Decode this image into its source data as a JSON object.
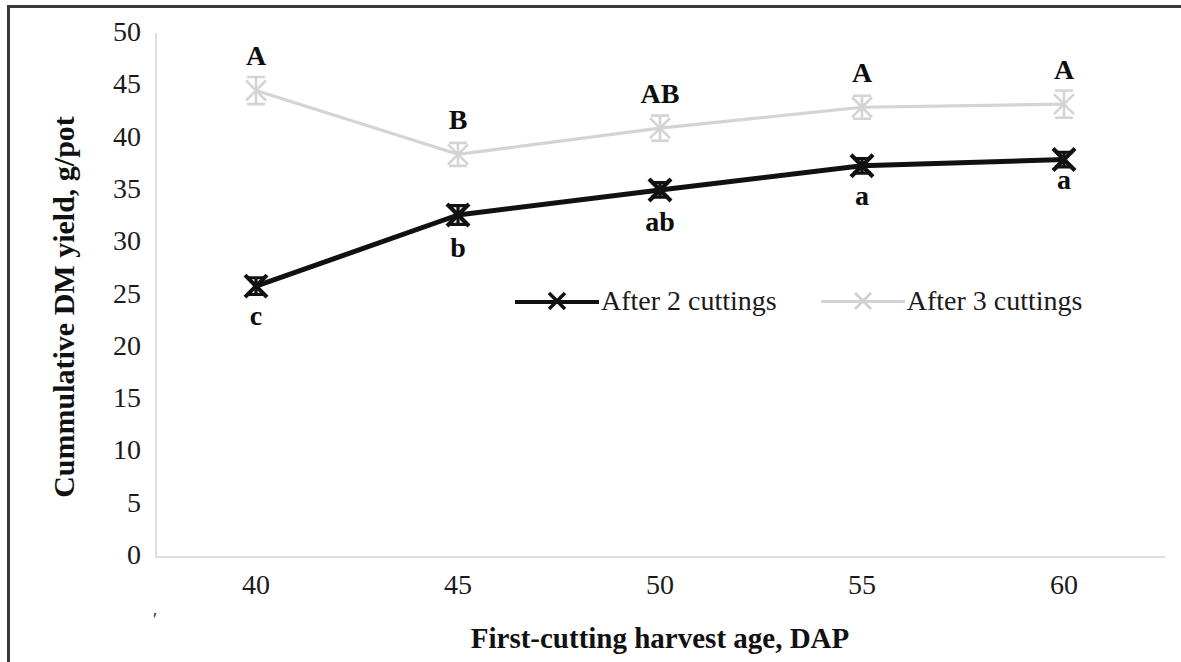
{
  "chart_data": {
    "type": "line",
    "title": "",
    "xlabel": "First-cutting harvest age, DAP",
    "ylabel": "Cummulative DM yield, g/pot",
    "x": [
      40,
      45,
      50,
      55,
      60
    ],
    "xtick_labels": [
      "40",
      "45",
      "50",
      "55",
      "60"
    ],
    "ytick_labels": [
      "0",
      "5",
      "10",
      "15",
      "20",
      "25",
      "30",
      "35",
      "40",
      "45",
      "50"
    ],
    "yticks": [
      0,
      5,
      10,
      15,
      20,
      25,
      30,
      35,
      40,
      45,
      50
    ],
    "ylim": [
      0,
      50
    ],
    "xlim": [
      37.5,
      62.5
    ],
    "grid": false,
    "legend_position": "inside-center",
    "series": [
      {
        "name": "After 2 cuttings",
        "color": "#111111",
        "marker": "x",
        "values": [
          25.8,
          32.6,
          35.0,
          37.3,
          37.9
        ],
        "errors": [
          0.8,
          0.9,
          0.7,
          0.7,
          0.7
        ],
        "labels": [
          "c",
          "b",
          "ab",
          "a",
          "a"
        ],
        "label_position": [
          "below",
          "below",
          "below",
          "below",
          "below"
        ]
      },
      {
        "name": "After 3 cuttings",
        "color": "#d4d4d4",
        "marker": "x",
        "values": [
          44.5,
          38.4,
          40.9,
          42.9,
          43.2
        ],
        "errors": [
          1.3,
          1.1,
          1.2,
          1.1,
          1.3
        ],
        "labels": [
          "A",
          "B",
          "AB",
          "A",
          "A"
        ],
        "label_position": [
          "above",
          "above",
          "above",
          "above",
          "above"
        ]
      }
    ],
    "annotations": [
      {
        "text": "A",
        "x": 40,
        "y": 47.6
      },
      {
        "text": "B",
        "x": 45,
        "y": 41.5
      },
      {
        "text": "AB",
        "x": 50,
        "y": 44.0
      },
      {
        "text": "A",
        "x": 55,
        "y": 46.0
      },
      {
        "text": "A",
        "x": 60,
        "y": 46.3
      },
      {
        "text": "c",
        "x": 40,
        "y": 22.8
      },
      {
        "text": "b",
        "x": 45,
        "y": 29.3
      },
      {
        "text": "ab",
        "x": 50,
        "y": 31.7
      },
      {
        "text": "a",
        "x": 55,
        "y": 34.2
      },
      {
        "text": "a",
        "x": 60,
        "y": 35.8
      }
    ]
  },
  "legend": {
    "items": [
      {
        "label": "After 2 cuttings",
        "color": "#111111"
      },
      {
        "label": "After 3 cuttings",
        "color": "#d4d4d4"
      }
    ]
  },
  "axes": {
    "y_title": "Cummulative DM yield, g/pot",
    "x_title": "First-cutting harvest age, DAP"
  },
  "marks": {
    "scan_artifact": "'"
  }
}
